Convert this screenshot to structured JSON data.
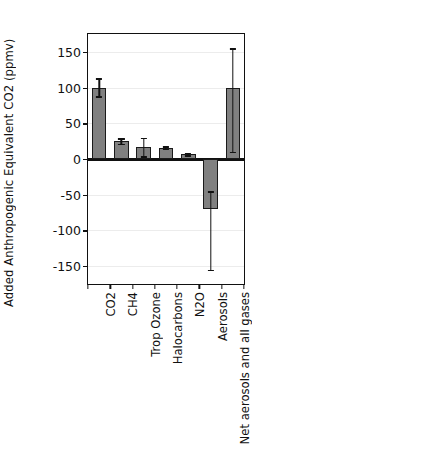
{
  "figure": {
    "background_color": "#ffffff",
    "bar_fill_color": "#808080",
    "bar_edge_color": "#1a1a1a",
    "grid_color": "#ececec"
  },
  "chart_data": [
    {
      "type": "bar",
      "panel": "left",
      "title": "",
      "xlabel": "",
      "ylabel": "Added Anthropogenic  Equivalent CO2 (ppmv)",
      "ylim": [
        -175,
        175
      ],
      "yticks": [
        150,
        100,
        50,
        0,
        -50,
        -100,
        -150
      ],
      "ytick_labels": [
        "150",
        "100",
        "50",
        "0",
        "-50",
        "-100",
        "-150"
      ],
      "grid": true,
      "legend": "none",
      "categories": [
        "CO2",
        "CH4",
        "Trop Ozone",
        "Halocarbons",
        "N2O",
        "Aerosols",
        "Net aerosols and all gases"
      ],
      "values": [
        100,
        25,
        17,
        16,
        7,
        -70,
        100
      ],
      "error_low": [
        88,
        21,
        4,
        14,
        5,
        -155,
        10
      ],
      "error_high": [
        113,
        29,
        30,
        18,
        9,
        -45,
        155
      ]
    },
    {
      "type": "bar",
      "panel": "right",
      "title": "",
      "xlabel": "",
      "ylabel": "Total equivalent CO2 (ppmv)",
      "ylim": [
        0,
        520
      ],
      "yticks": [
        500,
        400,
        300,
        200,
        100,
        0
      ],
      "ytick_labels": [
        "500",
        "400",
        "300",
        "200",
        "100",
        "0"
      ],
      "grid": true,
      "legend": "none",
      "categories": [
        "CO2",
        "CO2+other gases",
        "Net aerosols and all gases"
      ],
      "values": [
        378,
        450,
        378
      ],
      "error_low": [
        363,
        432,
        297
      ],
      "error_high": [
        393,
        468,
        458
      ]
    }
  ]
}
